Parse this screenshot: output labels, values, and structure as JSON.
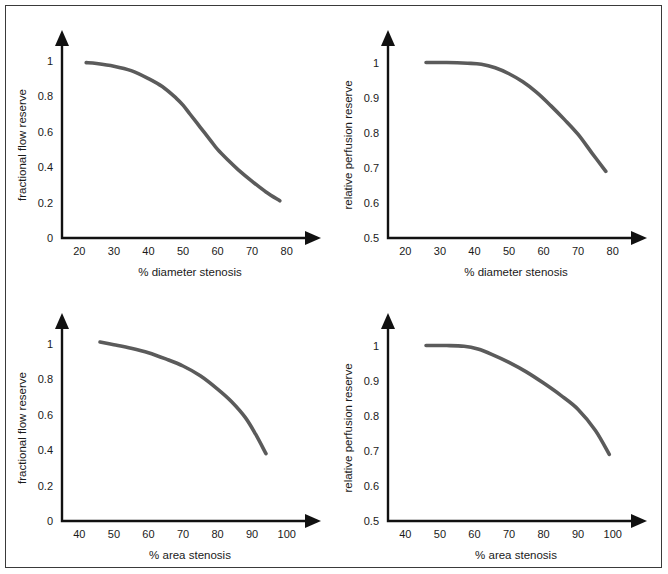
{
  "figure": {
    "border_color": "#3a3a3a",
    "background": "#ffffff",
    "curve_color": "#5b5b5b",
    "axis_color": "#111111"
  },
  "chart_data": [
    {
      "id": "ffr-diameter",
      "type": "line",
      "title": "",
      "xlabel": "% diameter stenosis",
      "ylabel": "fractional flow reserve",
      "xlim": [
        15,
        85
      ],
      "ylim": [
        0,
        1.05
      ],
      "xticks": [
        20,
        30,
        40,
        50,
        60,
        70,
        80
      ],
      "xtick_labels": [
        "20",
        "30",
        "40",
        "50",
        "60",
        "70",
        "80"
      ],
      "yticks": [
        0,
        0.2,
        0.4,
        0.6,
        0.8,
        1
      ],
      "ytick_labels": [
        "0",
        "0.2",
        "0.4",
        "0.6",
        "0.8",
        "1"
      ],
      "grid": false,
      "legend": "none",
      "x": [
        22,
        25,
        30,
        35,
        40,
        44,
        48,
        50,
        52,
        55,
        58,
        60,
        63,
        66,
        70,
        74,
        78
      ],
      "y": [
        0.99,
        0.985,
        0.97,
        0.945,
        0.9,
        0.855,
        0.79,
        0.75,
        0.7,
        0.625,
        0.55,
        0.5,
        0.44,
        0.385,
        0.32,
        0.26,
        0.21
      ]
    },
    {
      "id": "rpr-diameter",
      "type": "line",
      "title": "",
      "xlabel": "% diameter stenosis",
      "ylabel": "relative perfusion reserve",
      "xlim": [
        15,
        85
      ],
      "ylim": [
        0.5,
        1.03
      ],
      "xticks": [
        20,
        30,
        40,
        50,
        60,
        70,
        80
      ],
      "xtick_labels": [
        "20",
        "30",
        "40",
        "50",
        "60",
        "70",
        "80"
      ],
      "yticks": [
        0.5,
        0.6,
        0.7,
        0.8,
        0.9,
        1
      ],
      "ytick_labels": [
        "0.5",
        "0.6",
        "0.7",
        "0.8",
        "0.9",
        "1"
      ],
      "grid": false,
      "legend": "none",
      "x": [
        26,
        32,
        38,
        42,
        46,
        50,
        54,
        58,
        62,
        66,
        70,
        74,
        78
      ],
      "y": [
        1.0,
        1.0,
        0.998,
        0.995,
        0.985,
        0.968,
        0.945,
        0.915,
        0.878,
        0.838,
        0.795,
        0.742,
        0.69
      ]
    },
    {
      "id": "ffr-area",
      "type": "line",
      "title": "",
      "xlabel": "% area stenosis",
      "ylabel": "fractional flow reserve",
      "xlim": [
        35,
        105
      ],
      "ylim": [
        0,
        1.05
      ],
      "xticks": [
        40,
        50,
        60,
        70,
        80,
        90,
        100
      ],
      "xtick_labels": [
        "40",
        "50",
        "60",
        "70",
        "80",
        "90",
        "100"
      ],
      "yticks": [
        0,
        0.2,
        0.4,
        0.6,
        0.8,
        1
      ],
      "ytick_labels": [
        "0",
        "0.2",
        "0.4",
        "0.6",
        "0.8",
        "1"
      ],
      "grid": false,
      "legend": "none",
      "x": [
        46,
        50,
        55,
        60,
        65,
        70,
        75,
        80,
        84,
        88,
        91,
        94
      ],
      "y": [
        1.01,
        0.995,
        0.975,
        0.95,
        0.915,
        0.875,
        0.82,
        0.745,
        0.675,
        0.585,
        0.49,
        0.38
      ]
    },
    {
      "id": "rpr-area",
      "type": "line",
      "title": "",
      "xlabel": "% area stenosis",
      "ylabel": "relative perfusion reserve",
      "xlim": [
        35,
        105
      ],
      "ylim": [
        0.5,
        1.03
      ],
      "xticks": [
        40,
        50,
        60,
        70,
        80,
        90,
        100
      ],
      "xtick_labels": [
        "40",
        "50",
        "60",
        "70",
        "80",
        "90",
        "100"
      ],
      "yticks": [
        0.5,
        0.6,
        0.7,
        0.8,
        0.9,
        1
      ],
      "ytick_labels": [
        "0.5",
        "0.6",
        "0.7",
        "0.8",
        "0.9",
        "1"
      ],
      "grid": false,
      "legend": "none",
      "x": [
        46,
        52,
        57,
        61,
        65,
        70,
        75,
        80,
        85,
        90,
        95,
        99
      ],
      "y": [
        1.0,
        1.0,
        0.998,
        0.99,
        0.975,
        0.952,
        0.925,
        0.893,
        0.858,
        0.818,
        0.758,
        0.69
      ]
    }
  ]
}
